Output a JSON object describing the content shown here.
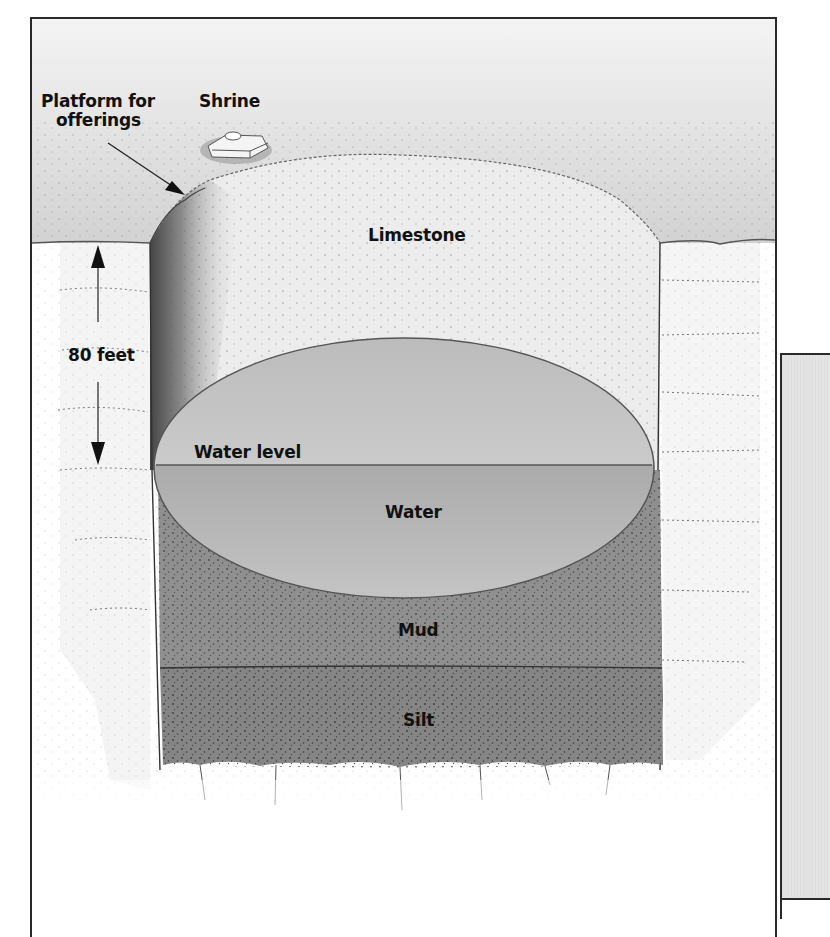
{
  "diagram": {
    "labels": {
      "platform": "Platform for offerings",
      "platform_line1": "Platform for",
      "platform_line2": "offerings",
      "shrine": "Shrine",
      "limestone": "Limestone",
      "depth": "80 feet",
      "water_level": "Water level",
      "water": "Water",
      "mud": "Mud",
      "silt": "Silt"
    },
    "layers": [
      {
        "name": "Limestone",
        "color": "#eeeeee"
      },
      {
        "name": "Water (above level, cavity)",
        "color": "#c9c9c9"
      },
      {
        "name": "Water",
        "color": "#9a9a9a"
      },
      {
        "name": "Mud",
        "color": "#8e8e8e"
      },
      {
        "name": "Silt",
        "color": "#8a8a8a"
      }
    ],
    "measurement": {
      "value": 80,
      "unit": "feet",
      "from": "ground surface",
      "to": "water level"
    },
    "colors": {
      "frame": "#2a2a2a",
      "ground_surface": "#d6d6d6",
      "label_text": "#111111"
    }
  }
}
